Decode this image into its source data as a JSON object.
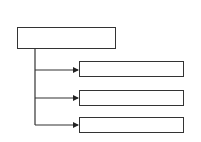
{
  "diagram": {
    "type": "tree",
    "stroke_color": "#333333",
    "root": {
      "label": "",
      "x": 17,
      "y": 27,
      "w": 99,
      "h": 22
    },
    "children": [
      {
        "label": "",
        "x": 79,
        "y": 61,
        "w": 105,
        "h": 16,
        "arrow_y": 70
      },
      {
        "label": "",
        "x": 79,
        "y": 90,
        "w": 105,
        "h": 16,
        "arrow_y": 98
      },
      {
        "label": "",
        "x": 79,
        "y": 117,
        "w": 105,
        "h": 16,
        "arrow_y": 125
      }
    ],
    "trunk_x": 35
  }
}
